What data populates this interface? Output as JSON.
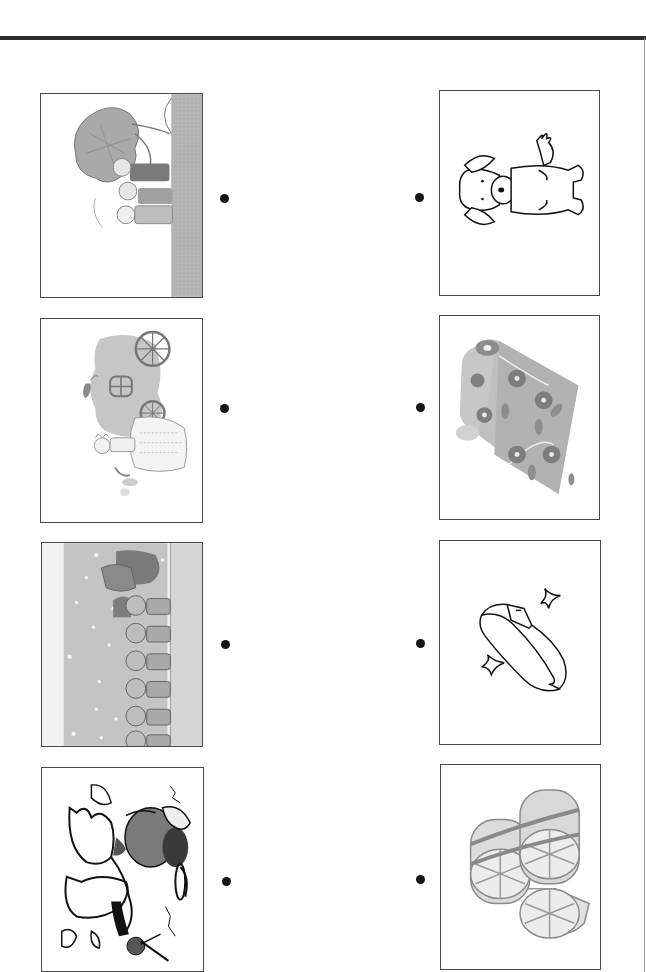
{
  "worksheet": {
    "type": "matching-exercise",
    "orientation": "rotated-90",
    "left_column": {
      "items": [
        {
          "id": "story-1",
          "icon": "tree-scene-icon",
          "description": "People pulling under a large leafy tree beside a ground strip"
        },
        {
          "id": "story-2",
          "icon": "princess-pumpkin-carriage-icon",
          "description": "Princess in gown beside a pumpkin carriage with wheels"
        },
        {
          "id": "story-3",
          "icon": "jizo-statues-snow-icon",
          "description": "Row of stone statues in the snow with a person in a straw hat"
        },
        {
          "id": "story-4",
          "icon": "crane-rescue-icon",
          "description": "Crane bird flapping near a man with a hat"
        }
      ]
    },
    "right_column": {
      "items": [
        {
          "id": "object-1",
          "icon": "dog-icon",
          "description": "Cartoon dog sitting"
        },
        {
          "id": "object-2",
          "icon": "cloth-roll-icon",
          "description": "Roll of flower-patterned fabric"
        },
        {
          "id": "object-3",
          "icon": "glass-slipper-icon",
          "description": "Shiny shoe with sparkles"
        },
        {
          "id": "object-4",
          "icon": "straw-hats-icon",
          "description": "Stack of woven straw hats / bales"
        }
      ]
    },
    "colors": {
      "rule": "#2e2e2e",
      "frame": "#4a4a4a",
      "dot": "#151515",
      "shade_light": "#cfcfcf",
      "shade_mid": "#a8a8a8",
      "shade_dark": "#6a6a6a"
    }
  }
}
